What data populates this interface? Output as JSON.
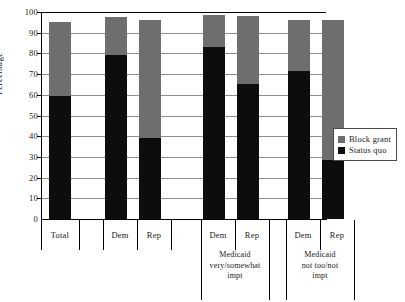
{
  "chart_data": {
    "type": "bar",
    "subtype": "stacked-bar",
    "title": "",
    "xlabel": "",
    "ylabel": "Percentage",
    "ylim": [
      0,
      100
    ],
    "yticks": [
      0,
      10,
      20,
      30,
      40,
      50,
      60,
      70,
      80,
      90,
      100
    ],
    "grid": true,
    "legend_position": "right",
    "categories": [
      "Total",
      "Dem",
      "Rep",
      "Dem",
      "Rep",
      "Dem",
      "Rep"
    ],
    "groups": [
      {
        "label": "",
        "categories": [
          "Total"
        ]
      },
      {
        "label": "",
        "categories": [
          "Dem",
          "Rep"
        ]
      },
      {
        "label": "Medicaid very/somewhat impt",
        "label_lines": [
          "Medicaid",
          "very/somewhat",
          "impt"
        ],
        "categories": [
          "Dem",
          "Rep"
        ]
      },
      {
        "label": "Medicaid not too/not impt",
        "label_lines": [
          "Medicaid",
          "not too/not",
          "impt"
        ],
        "categories": [
          "Dem",
          "Rep"
        ]
      }
    ],
    "series": [
      {
        "name": "Status quo",
        "color": "#0d0d0d",
        "values": [
          59.5,
          79,
          39,
          83,
          65,
          71.5,
          28.5
        ]
      },
      {
        "name": "Block grant",
        "color": "#6e6e6e",
        "values": [
          35.5,
          18.5,
          57,
          15.5,
          33,
          24.5,
          67.5
        ]
      }
    ],
    "totals": [
      95,
      97.5,
      96,
      98.5,
      98,
      96,
      96
    ]
  },
  "axis": {
    "y_title": "Percentage",
    "y_labels": [
      "100",
      "90",
      "80",
      "70",
      "60",
      "50",
      "40",
      "30",
      "20",
      "10",
      "0"
    ]
  },
  "categories": [
    {
      "label": "Total"
    },
    {
      "label": "Dem"
    },
    {
      "label": "Rep"
    },
    {
      "label": "Dem"
    },
    {
      "label": "Rep"
    },
    {
      "label": "Dem"
    },
    {
      "label": "Rep"
    }
  ],
  "group_labels": [
    {
      "line1": "Medicaid",
      "line2": "very/somewhat",
      "line3": "impt"
    },
    {
      "line1": "Medicaid",
      "line2": "not too/not",
      "line3": "impt"
    }
  ],
  "legend": {
    "items": [
      {
        "label": "Block grant",
        "color": "#6e6e6e"
      },
      {
        "label": "Status quo",
        "color": "#0d0d0d"
      }
    ]
  }
}
